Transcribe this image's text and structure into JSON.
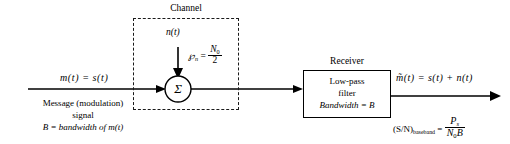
{
  "diagram": {
    "channel": {
      "label": "Channel",
      "noise_signal": "n(t)",
      "noise_psd_symbol": "℘",
      "noise_psd_sub": "n",
      "noise_psd_eq": "=",
      "noise_psd_num": "N",
      "noise_psd_num_sub": "0",
      "noise_psd_den": "2"
    },
    "summer": {
      "symbol": "Σ"
    },
    "input": {
      "signal": "m(t) = s(t)",
      "caption_line1": "Message (modulation)",
      "caption_line2": "signal",
      "caption_line3": "B = bandwidth of m(t)"
    },
    "receiver": {
      "label": "Receiver",
      "line1": "Low-pass",
      "line2": "filter",
      "line3": "Bandwidth = B"
    },
    "output": {
      "signal": "m̃(t) = s(t) + n(t)",
      "snr_label": "(S/N)",
      "snr_sub": "baseband",
      "snr_eq": "=",
      "snr_num": "P",
      "snr_num_sub": "s",
      "snr_den_n": "N",
      "snr_den_n_sub": "0",
      "snr_den_b": "B"
    }
  },
  "colors": {
    "ink": "#000000",
    "dash": "#1a1a1a",
    "paper": "#ffffff"
  }
}
